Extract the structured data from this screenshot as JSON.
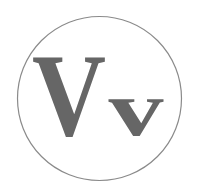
{
  "logo": {
    "upper_letter": "V",
    "lower_letter": "v",
    "letter_color": "#666666",
    "circle_color": "#8a8a8a",
    "background": "#ffffff"
  }
}
